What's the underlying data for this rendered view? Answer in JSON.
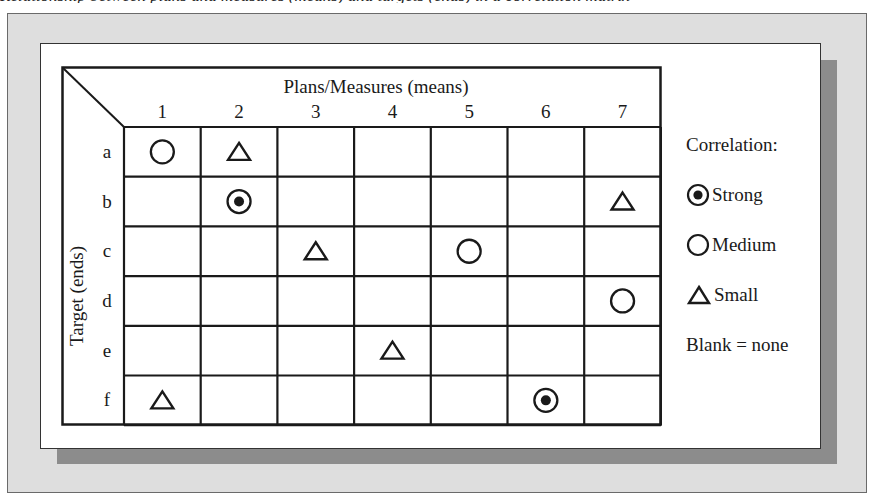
{
  "caption_fragment": "Relationship between plans and measures (means) and targets (ends) in a correlation matrix",
  "matrix": {
    "column_header": "Plans/Measures (means)",
    "row_header": "Target (ends)",
    "columns": [
      "1",
      "2",
      "3",
      "4",
      "5",
      "6",
      "7"
    ],
    "rows": [
      "a",
      "b",
      "c",
      "d",
      "e",
      "f"
    ],
    "cells": [
      {
        "row": "a",
        "col": "1",
        "correlation": "medium"
      },
      {
        "row": "a",
        "col": "2",
        "correlation": "small"
      },
      {
        "row": "b",
        "col": "2",
        "correlation": "strong"
      },
      {
        "row": "b",
        "col": "7",
        "correlation": "small"
      },
      {
        "row": "c",
        "col": "3",
        "correlation": "small"
      },
      {
        "row": "c",
        "col": "5",
        "correlation": "medium"
      },
      {
        "row": "d",
        "col": "7",
        "correlation": "medium"
      },
      {
        "row": "e",
        "col": "4",
        "correlation": "small"
      },
      {
        "row": "f",
        "col": "1",
        "correlation": "small"
      },
      {
        "row": "f",
        "col": "6",
        "correlation": "strong"
      }
    ]
  },
  "legend": {
    "title": "Correlation:",
    "items": [
      {
        "key": "strong",
        "label": "Strong",
        "icon": "bullseye-icon"
      },
      {
        "key": "medium",
        "label": "Medium",
        "icon": "circle-icon"
      },
      {
        "key": "small",
        "label": "Small",
        "icon": "triangle-icon"
      }
    ],
    "note": "Blank = none"
  },
  "colors": {
    "frame_bg": "#dedede",
    "shadow": "#8c8c8c",
    "panel_bg": "#ffffff",
    "ink": "#1a1a1a"
  }
}
